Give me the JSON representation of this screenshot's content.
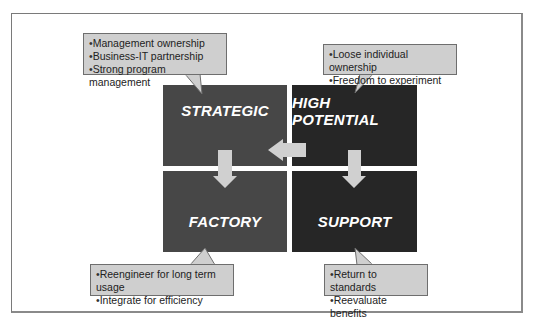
{
  "diagram": {
    "type": "2x2 matrix with callouts",
    "quadrants": [
      {
        "id": "strategic",
        "label": "STRATEGIC",
        "position": "top-left",
        "color": "#474747"
      },
      {
        "id": "high_potential",
        "label": "HIGH POTENTIAL",
        "position": "top-right",
        "color": "#262626"
      },
      {
        "id": "factory",
        "label": "FACTORY",
        "position": "bottom-left",
        "color": "#474747"
      },
      {
        "id": "support",
        "label": "SUPPORT",
        "position": "bottom-right",
        "color": "#262626"
      }
    ],
    "arrows": [
      {
        "from": "high_potential",
        "to": "strategic",
        "direction": "left"
      },
      {
        "from": "strategic",
        "to": "factory",
        "direction": "down"
      },
      {
        "from": "high_potential",
        "to": "support",
        "direction": "down"
      }
    ],
    "callouts": {
      "strategic": [
        "Management ownership",
        "Business-IT partnership",
        "Strong program management"
      ],
      "high_potential": [
        "Loose individual ownership",
        "Freedom to experiment"
      ],
      "factory": [
        "Reengineer for long term usage",
        "Integrate for efficiency"
      ],
      "support": [
        "Return to standards",
        "Reevaluate benefits"
      ]
    },
    "colors": {
      "arrow": "#cfcfcf",
      "callout_bg": "#cfcfcf",
      "callout_border": "#6e6e6e"
    }
  }
}
